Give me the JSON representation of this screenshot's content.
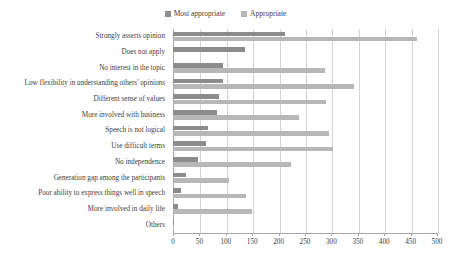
{
  "chart_data": {
    "type": "bar",
    "orientation": "horizontal",
    "title": "",
    "xlabel": "",
    "ylabel": "",
    "xlim": [
      0,
      500
    ],
    "xticks": [
      0,
      50,
      100,
      150,
      200,
      250,
      300,
      350,
      400,
      450,
      500
    ],
    "grid": true,
    "legend_position": "top-center",
    "categories": [
      "Strongly asserts opinion",
      "Does not apply",
      "No interest in the topic",
      "Low flexibility in understanding others' opinions",
      "Different sense of values",
      "More involved with business",
      "Speech is not logical",
      "Use difficult terms",
      "No independence",
      "Generation gap among the participants",
      "Poor ability to express things well in speech",
      "More involved in daily life",
      "Others"
    ],
    "series": [
      {
        "name": "Most appropriate",
        "color": "#8c8c8c",
        "values": [
          212,
          137,
          94,
          94,
          87,
          83,
          67,
          63,
          48,
          24,
          16,
          10,
          2
        ]
      },
      {
        "name": "Appropriate",
        "color": "#b7b7b7",
        "values": [
          463,
          0,
          287,
          343,
          290,
          239,
          296,
          303,
          224,
          107,
          139,
          150,
          1
        ]
      }
    ]
  },
  "legend": {
    "entries": [
      {
        "label": "Most appropriate",
        "color": "#8c8c8c"
      },
      {
        "label": "Appropriate",
        "color": "#b7b7b7"
      }
    ]
  },
  "axis": {
    "tick_labels": [
      "0",
      "50",
      "100",
      "150",
      "200",
      "250",
      "300",
      "350",
      "400",
      "450",
      "500"
    ]
  }
}
